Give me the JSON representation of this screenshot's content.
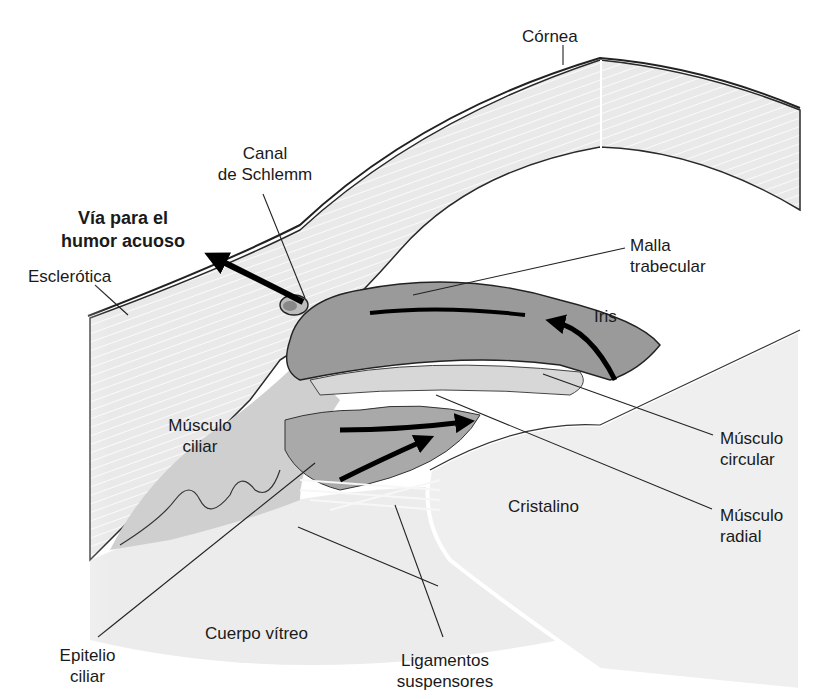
{
  "figure": {
    "language": "es"
  },
  "labels": {
    "cornea": {
      "lines": [
        "Córnea"
      ]
    },
    "canal_schlemm": {
      "lines": [
        "Canal",
        "de Schlemm"
      ]
    },
    "via_humor": {
      "lines": [
        "Vía para el",
        "humor acuoso"
      ]
    },
    "esclerotica": {
      "lines": [
        "Esclerótica"
      ]
    },
    "malla_trabecular": {
      "lines": [
        "Malla",
        "trabecular"
      ]
    },
    "iris": {
      "lines": [
        "Iris"
      ]
    },
    "musculo_ciliar": {
      "lines": [
        "Músculo",
        "ciliar"
      ]
    },
    "musculo_circular": {
      "lines": [
        "Músculo",
        "circular"
      ]
    },
    "cristalino": {
      "lines": [
        "Cristalino"
      ]
    },
    "musculo_radial": {
      "lines": [
        "Músculo",
        "radial"
      ]
    },
    "cuerpo_vitreo": {
      "lines": [
        "Cuerpo vítreo"
      ]
    },
    "epitelio_ciliar": {
      "lines": [
        "Epitelio",
        "ciliar"
      ]
    },
    "ligamentos": {
      "lines": [
        "Ligamentos",
        "suspensores"
      ]
    }
  },
  "colors": {
    "tissue_light": "#e6e6e6",
    "tissue_mid": "#bdbdbd",
    "iris_dark": "#8f8f8f",
    "outline": "#222222",
    "arrow": "#000000"
  }
}
